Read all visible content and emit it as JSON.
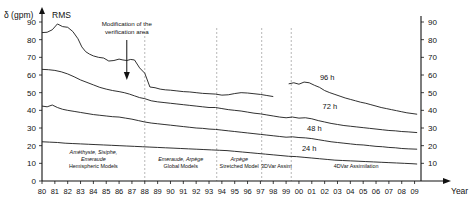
{
  "chart_data": {
    "type": "line",
    "title": "RMS",
    "ylabel": "δ (gpm)",
    "xlabel": "Year",
    "ylim": [
      0,
      90
    ],
    "yticks": [
      0,
      10,
      20,
      30,
      40,
      50,
      60,
      70,
      80,
      90
    ],
    "yticks_right": [
      10,
      20,
      30,
      40,
      50,
      60,
      70,
      80,
      90
    ],
    "grid": false,
    "legend": "inline-curve-labels",
    "x": [
      "80",
      "81",
      "82",
      "83",
      "84",
      "85",
      "86",
      "87",
      "88",
      "89",
      "90",
      "91",
      "92",
      "93",
      "94",
      "95",
      "96",
      "97",
      "98",
      "99",
      "00",
      "01",
      "02",
      "03",
      "04",
      "05",
      "06",
      "07",
      "08",
      "09"
    ],
    "xlim": [
      1980,
      2009.5
    ],
    "series": [
      {
        "name": "96 h",
        "label": "96 h",
        "color": "#1a1a1a",
        "segments": [
          {
            "x": [
              1980.0,
              1980.4,
              1980.8,
              1981.2,
              1981.6,
              1982.0,
              1982.4,
              1982.8,
              1983.1,
              1983.4,
              1983.7,
              1984.0,
              1984.4,
              1984.8,
              1985.2,
              1985.6,
              1986.0,
              1986.3,
              1986.6,
              1986.9,
              1987.2,
              1987.6,
              1988.0,
              1988.4,
              1988.8,
              1989.2,
              1989.6,
              1990.0,
              1990.5,
              1991.0,
              1991.5,
              1992.0,
              1992.5,
              1993.0,
              1993.5,
              1994.0,
              1994.5,
              1995.0,
              1995.5,
              1996.0,
              1996.5,
              1997.0,
              1997.5,
              1998.0
            ],
            "y": [
              84.0,
              84.2,
              85.6,
              88.9,
              87.4,
              87.0,
              84.6,
              80.5,
              75.9,
              73.2,
              71.8,
              70.8,
              70.0,
              69.6,
              67.9,
              68.2,
              69.0,
              68.5,
              68.2,
              68.8,
              68.5,
              64.0,
              61.0,
              53.2,
              52.8,
              52.0,
              51.6,
              51.4,
              51.0,
              50.6,
              50.4,
              50.0,
              49.6,
              49.4,
              49.2,
              48.6,
              48.8,
              49.5,
              50.0,
              49.8,
              49.4,
              49.0,
              48.4,
              47.8
            ]
          },
          {
            "x": [
              1999.2,
              1999.6,
              2000.0,
              2000.4,
              2000.8,
              2001.2,
              2001.6,
              2002.0,
              2002.4,
              2002.8,
              2003.2,
              2003.6,
              2004.0,
              2004.4,
              2004.8,
              2005.2,
              2005.6,
              2006.0,
              2006.4,
              2006.8,
              2007.2,
              2007.6,
              2008.0,
              2008.4,
              2008.8,
              2009.2
            ],
            "y": [
              55.0,
              55.6,
              54.8,
              56.0,
              55.6,
              54.2,
              53.0,
              51.2,
              50.0,
              49.0,
              48.0,
              47.0,
              46.2,
              45.4,
              44.6,
              44.0,
              43.2,
              42.4,
              41.6,
              41.0,
              40.4,
              39.8,
              39.2,
              38.6,
              38.2,
              37.8
            ]
          }
        ]
      },
      {
        "name": "72 h",
        "label": "72 h",
        "color": "#1a1a1a",
        "segments": [
          {
            "x": [
              1980.0,
              1980.5,
              1981.0,
              1981.5,
              1982.0,
              1982.5,
              1983.0,
              1983.5,
              1984.0,
              1984.5,
              1985.0,
              1985.5,
              1986.0,
              1986.4,
              1986.8,
              1987.2,
              1987.6,
              1988.0,
              1988.5,
              1989.0,
              1989.5,
              1990.0,
              1990.5,
              1991.0,
              1991.5,
              1992.0,
              1992.5,
              1993.0,
              1993.5,
              1994.0,
              1994.5,
              1995.0,
              1995.5,
              1996.0,
              1996.5,
              1997.0,
              1997.5,
              1998.0,
              1998.5,
              1999.0,
              1999.5,
              2000.0,
              2000.5,
              2001.0,
              2001.5,
              2002.0,
              2002.5,
              2003.0,
              2003.5,
              2004.0,
              2004.5,
              2005.0,
              2005.5,
              2006.0,
              2006.5,
              2007.0,
              2007.5,
              2008.0,
              2008.5,
              2009.2
            ],
            "y": [
              63.2,
              63.0,
              62.6,
              61.8,
              60.6,
              59.0,
              57.2,
              55.8,
              54.4,
              53.0,
              52.0,
              51.2,
              50.6,
              50.0,
              49.2,
              48.2,
              47.2,
              46.6,
              45.4,
              44.8,
              44.4,
              44.0,
              43.6,
              43.2,
              42.8,
              42.4,
              42.0,
              41.6,
              41.6,
              41.0,
              40.4,
              40.0,
              39.6,
              39.0,
              38.4,
              38.0,
              37.4,
              36.8,
              36.2,
              35.8,
              36.2,
              35.6,
              35.8,
              35.2,
              34.2,
              33.4,
              32.6,
              32.0,
              31.4,
              31.0,
              30.6,
              30.2,
              29.8,
              29.4,
              29.0,
              28.6,
              28.4,
              28.0,
              27.8,
              27.4
            ]
          }
        ]
      },
      {
        "name": "48 h",
        "label": "48 h",
        "color": "#1a1a1a",
        "segments": [
          {
            "x": [
              1980.0,
              1980.4,
              1980.8,
              1981.2,
              1981.6,
              1982.0,
              1982.5,
              1983.0,
              1983.5,
              1984.0,
              1984.5,
              1985.0,
              1985.5,
              1986.0,
              1986.5,
              1987.0,
              1987.5,
              1988.0,
              1988.5,
              1989.0,
              1989.5,
              1990.0,
              1990.5,
              1991.0,
              1991.5,
              1992.0,
              1992.5,
              1993.0,
              1993.5,
              1994.0,
              1994.5,
              1995.0,
              1995.5,
              1996.0,
              1996.5,
              1997.0,
              1997.5,
              1998.0,
              1998.5,
              1999.0,
              1999.5,
              2000.0,
              2000.5,
              2001.0,
              2001.5,
              2002.0,
              2002.5,
              2003.0,
              2003.5,
              2004.0,
              2004.5,
              2005.0,
              2005.5,
              2006.0,
              2006.5,
              2007.0,
              2007.5,
              2008.0,
              2008.5,
              2009.2
            ],
            "y": [
              42.4,
              42.0,
              43.0,
              41.6,
              40.6,
              40.0,
              39.4,
              38.8,
              38.2,
              37.6,
              37.2,
              36.8,
              36.4,
              36.2,
              35.6,
              35.0,
              34.2,
              33.4,
              32.8,
              32.4,
              32.0,
              31.6,
              31.2,
              30.8,
              30.4,
              30.0,
              29.8,
              29.4,
              29.2,
              28.8,
              28.4,
              28.0,
              27.6,
              27.2,
              26.8,
              26.4,
              26.0,
              25.6,
              25.2,
              24.8,
              25.0,
              24.6,
              24.4,
              24.0,
              23.4,
              22.8,
              22.2,
              21.8,
              21.4,
              21.0,
              20.6,
              20.4,
              20.0,
              19.6,
              19.4,
              19.0,
              18.8,
              18.4,
              18.2,
              18.0
            ]
          }
        ]
      },
      {
        "name": "24 h",
        "label": "24 h",
        "color": "#1a1a1a",
        "segments": [
          {
            "x": [
              1980.0,
              1980.6,
              1981.2,
              1981.8,
              1982.4,
              1983.0,
              1983.6,
              1984.2,
              1984.8,
              1985.4,
              1986.0,
              1986.6,
              1987.2,
              1987.8,
              1988.4,
              1989.0,
              1989.6,
              1990.2,
              1990.8,
              1991.4,
              1992.0,
              1992.6,
              1993.2,
              1993.8,
              1994.4,
              1995.0,
              1995.6,
              1996.2,
              1996.8,
              1997.4,
              1998.0,
              1998.6,
              1999.2,
              1999.8,
              2000.4,
              2001.0,
              2001.6,
              2002.2,
              2002.8,
              2003.4,
              2004.0,
              2004.6,
              2005.2,
              2005.8,
              2006.4,
              2007.0,
              2007.6,
              2008.2,
              2008.8,
              2009.2
            ],
            "y": [
              22.2,
              22.0,
              21.8,
              21.4,
              21.2,
              21.0,
              20.8,
              20.6,
              20.4,
              20.2,
              20.0,
              19.8,
              19.6,
              19.4,
              19.2,
              19.0,
              18.8,
              18.6,
              18.4,
              18.2,
              18.0,
              17.8,
              17.6,
              17.4,
              17.2,
              16.8,
              16.4,
              16.0,
              15.6,
              15.2,
              14.8,
              14.4,
              14.0,
              13.8,
              13.4,
              13.0,
              12.6,
              12.2,
              11.8,
              11.6,
              11.4,
              11.2,
              11.0,
              10.8,
              10.6,
              10.4,
              10.2,
              10.0,
              9.8,
              9.6
            ]
          }
        ]
      }
    ],
    "annotations": [
      {
        "name": "verification-area-note",
        "text_line1": "Modification of the",
        "text_line2": "verification area",
        "x": 1986.6,
        "arrow": "down"
      }
    ],
    "era_dividers": [
      1988.0,
      1993.6,
      1997.1,
      1999.4
    ],
    "eras": [
      {
        "name": "hemispheric-models",
        "line1": "Améthyste, Sisiphe,",
        "line2": "Emeraude",
        "line3": "Hemispheric Models"
      },
      {
        "name": "global-models",
        "line1": "",
        "line2": "Emeraude, Arpège",
        "line3": "Global Models"
      },
      {
        "name": "stretched-model",
        "line1": "",
        "line2": "Arpège",
        "line3": "Stretched Model"
      },
      {
        "name": "3dvar-assim",
        "line1": "",
        "line2": "",
        "line3": "3DVar Assim"
      },
      {
        "name": "4dvar-assimilation",
        "line1": "",
        "line2": "",
        "line3": "4DVar Assimilation"
      }
    ]
  }
}
